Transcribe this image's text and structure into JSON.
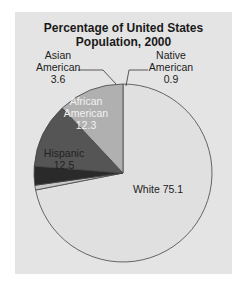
{
  "chart_data": {
    "type": "pie",
    "title": "Percentage of United States Population, 2000",
    "title_lines": [
      "Percentage of United States",
      "Population, 2000"
    ],
    "unit": "%",
    "slices": [
      {
        "label": "White",
        "value": 75.1,
        "color": "#e0e0e0"
      },
      {
        "label": "Native American",
        "value": 0.9,
        "color": "#c8c8c8"
      },
      {
        "label": "Asian American",
        "value": 3.6,
        "color": "#2a2a2a"
      },
      {
        "label": "African American",
        "value": 12.3,
        "color": "#555555"
      },
      {
        "label": "Hispanic",
        "value": 12.5,
        "color": "#b0b0b0"
      }
    ],
    "start_angle_deg": 0,
    "direction": "clockwise from 12 o'clock",
    "legend": "none (direct labels)"
  },
  "labels": {
    "white": {
      "name": "White",
      "value": "75.1",
      "text": "White 75.1"
    },
    "native": {
      "line1": "Native",
      "line2": "American",
      "value": "0.9"
    },
    "asian": {
      "line1": "Asian",
      "line2": "American",
      "value": "3.6"
    },
    "african": {
      "line1": "African",
      "line2": "American",
      "value": "12.3"
    },
    "hispanic": {
      "line1": "Hispanic",
      "value": "12.5"
    }
  }
}
